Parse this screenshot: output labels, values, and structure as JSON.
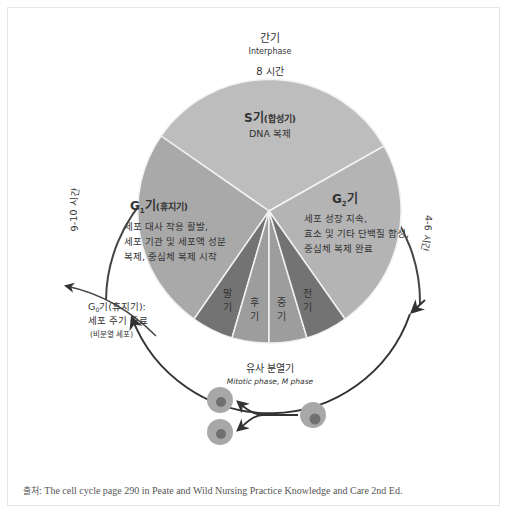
{
  "header": {
    "title_ko": "간기",
    "title_en": "Interphase",
    "s_duration": "8 시간",
    "g1_duration": "9-10 시간",
    "g2_duration": "4-6 시간"
  },
  "phases": {
    "s": {
      "label": "S기",
      "sub": "(합성기)",
      "desc": "DNA 복제",
      "color": "#bdbdbd"
    },
    "g1": {
      "label": "G",
      "sub_index": "1",
      "label_tail": "기",
      "sub": "(휴지기)",
      "desc": [
        "세포 대사 작용 활발,",
        "세포 기관 및 세포액 성분",
        "복제, 중심체 복제 시작"
      ],
      "color": "#a9a9a9"
    },
    "g2": {
      "label": "G",
      "sub_index": "2",
      "label_tail": "기",
      "desc": [
        "세포 성장 지속,",
        "효소 및 기타 단백질 합성,",
        "중심체 복제 완료"
      ],
      "color": "#b4b4b4"
    },
    "mitosis": [
      {
        "top": "말",
        "bottom": "기",
        "color": "#737373"
      },
      {
        "top": "후",
        "bottom": "기",
        "color": "#9d9d9d"
      },
      {
        "top": "중",
        "bottom": "기",
        "color": "#9d9d9d"
      },
      {
        "top": "전",
        "bottom": "기",
        "color": "#737373"
      }
    ]
  },
  "mitotic": {
    "title_ko": "유사 분열기",
    "title_en": "Mitotic phase, M phase"
  },
  "g0": {
    "label": "G",
    "sub_index": "0",
    "label_tail": "기(휴지기):",
    "line2": "세포 주기 종료",
    "line3": "(비분열 세포)"
  },
  "caption": {
    "prefix": "출처",
    "text": ": The cell cycle page 290 in Peate and Wild Nursing Practice Knowledge and Care 2nd Ed."
  }
}
